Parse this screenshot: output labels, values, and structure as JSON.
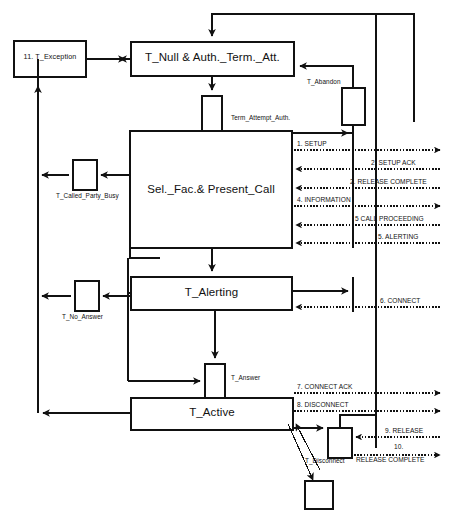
{
  "diagram": {
    "type": "state-transition-diagram",
    "colors": {
      "stroke": "#111111",
      "background": "#ffffff",
      "text": "#111111"
    }
  },
  "states": {
    "exception": {
      "label": "11. T_Exception",
      "x": 14,
      "y": 41,
      "w": 72,
      "h": 36
    },
    "null_auth": {
      "label": "T_Null & Auth._Term._Att.",
      "x": 131,
      "y": 42,
      "w": 163,
      "h": 34
    },
    "select_facility": {
      "label": "Sel._Fac.& Present_Call",
      "x": 130,
      "y": 131,
      "w": 162,
      "h": 117
    },
    "alerting": {
      "label": "T_Alerting",
      "x": 131,
      "y": 277,
      "w": 161,
      "h": 33
    },
    "active": {
      "label": "T_Active",
      "x": 131,
      "y": 398,
      "w": 162,
      "h": 32
    }
  },
  "transitions": {
    "term_attempt_auth": {
      "label": "Term_Attempt_Auth.",
      "box_x": 202,
      "box_y": 96,
      "box_w": 20,
      "box_h": 35
    },
    "t_abandon": {
      "label": "T_Abandon",
      "box_x": 342,
      "box_y": 88,
      "box_w": 23,
      "box_h": 37
    },
    "t_called_party_busy": {
      "label": "T_Called_Party_Busy",
      "box_x": 73,
      "box_y": 160,
      "box_w": 24,
      "box_h": 30
    },
    "t_no_answer": {
      "label": "T_No_Answer",
      "box_x": 75,
      "box_y": 281,
      "box_w": 24,
      "box_h": 30
    },
    "t_answer": {
      "label": "T_Answer",
      "box_x": 205,
      "box_y": 364,
      "box_w": 20,
      "box_h": 34
    },
    "t_disconnect": {
      "label": "T_Disconnect",
      "box_x": 328,
      "box_y": 428,
      "box_w": 24,
      "box_h": 30
    },
    "terminal_box": {
      "label": "",
      "box_x": 305,
      "box_y": 481,
      "box_w": 28,
      "box_h": 28
    }
  },
  "messages": [
    {
      "id": 1,
      "label": "1. SETUP",
      "direction": "right",
      "y": 150,
      "label_x": 297,
      "label_y": 141
    },
    {
      "id": 2,
      "label": "2. SETUP ACK",
      "direction": "left",
      "y": 169,
      "label_x": 368,
      "label_y": 160
    },
    {
      "id": 3,
      "label": "2. RELEASE COMPLETE",
      "direction": "left",
      "y": 188,
      "label_x": 348,
      "label_y": 179
    },
    {
      "id": 4,
      "label": "4. INFORMATION",
      "direction": "right",
      "y": 206,
      "label_x": 297,
      "label_y": 197
    },
    {
      "id": 5,
      "label": "5 CALL PROCEEDING",
      "direction": "left",
      "y": 225,
      "label_x": 352,
      "label_y": 216
    },
    {
      "id": 6,
      "label": "5. ALERTING",
      "direction": "left",
      "y": 243,
      "label_x": 375,
      "label_y": 234
    },
    {
      "id": 7,
      "label": "6. CONNECT",
      "direction": "left",
      "y": 307,
      "label_x": 378,
      "label_y": 298
    },
    {
      "id": 8,
      "label": "7. CONNECT ACK",
      "direction": "right",
      "y": 393,
      "label_x": 297,
      "label_y": 384
    },
    {
      "id": 9,
      "label": "8. DISCONNECT",
      "direction": "right",
      "y": 411,
      "label_x": 297,
      "label_y": 402
    },
    {
      "id": 10,
      "label": "9. RELEASE",
      "direction": "left",
      "y": 437,
      "label_x": 383,
      "label_y": 428
    },
    {
      "id": 11,
      "label": "10.",
      "direction": "right",
      "y": 455,
      "label_x": 392,
      "label_y": 443
    },
    {
      "id": 12,
      "label": "RELEASE COMPLETE",
      "direction": "none",
      "y": 455,
      "label_x": 380,
      "label_y": 452
    }
  ]
}
